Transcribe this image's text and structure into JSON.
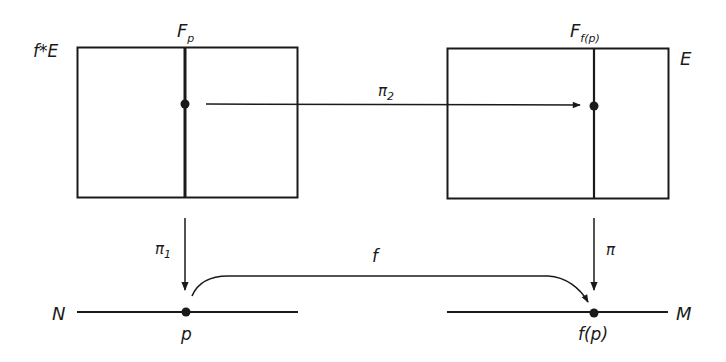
{
  "diagram": {
    "labels": {
      "pullback_bundle": "f*E",
      "bundle": "E",
      "fiber_left_main": "F",
      "fiber_left_sub": "p",
      "fiber_right_main": "F",
      "fiber_right_sub": "f(p)",
      "map_pi2_main": "π",
      "map_pi2_sub": "2",
      "map_pi1_main": "π",
      "map_pi1_sub": "1",
      "map_pi": "π",
      "map_f": "f",
      "base_left": "N",
      "base_right": "M",
      "point_left": "p",
      "point_right": "f(p)"
    },
    "colors": {
      "ink": "#1a1a1a",
      "background": "#ffffff"
    }
  }
}
